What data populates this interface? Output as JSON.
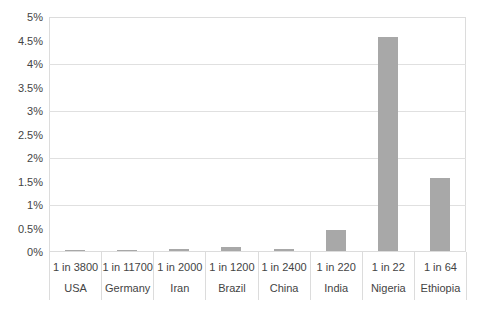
{
  "chart_data": {
    "type": "bar",
    "title": "",
    "subtitle": "",
    "xlabel": "",
    "ylabel": "",
    "categories": [
      "USA",
      "Germany",
      "Iran",
      "Brazil",
      "China",
      "India",
      "Nigeria",
      "Ethiopia"
    ],
    "category_ratio_labels": [
      "1 in 3800",
      "1 in 11700",
      "1 in 2000",
      "1 in 1200",
      "1 in 2400",
      "1 in 220",
      "1 in 22",
      "1 in 64"
    ],
    "values_percent": [
      0.026,
      0.009,
      0.05,
      0.083,
      0.042,
      0.455,
      4.545,
      1.563
    ],
    "ylim": [
      0,
      5
    ],
    "y_tick_labels": [
      "0%",
      "0.5%",
      "1%",
      "1.5%",
      "2%",
      "2.5%",
      "3%",
      "3.5%",
      "4%",
      "4.5%",
      "5%"
    ],
    "y_tick_step_percent": 0.5,
    "gridline_step_percent": 1,
    "grid": "horizontal-major-only",
    "legend": "none",
    "colors": {
      "bar": "#a8a8a8",
      "gridline": "#e0e0e0",
      "plot_border": "#dcdcdc",
      "axis_text": "#444444",
      "background": "#ffffff"
    }
  }
}
